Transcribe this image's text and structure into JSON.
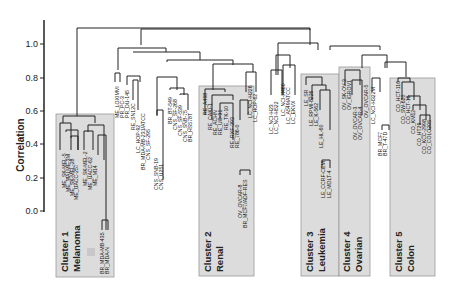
{
  "figure": {
    "y_axis": {
      "label": "Correlation",
      "ticks": [
        "0.0",
        "0.2",
        "0.4",
        "0.6",
        "0.8",
        "1.0"
      ]
    },
    "clusters": [
      {
        "number": "Cluster 1",
        "name": "Melanoma"
      },
      {
        "number": "Cluster 2",
        "name": "Renal"
      },
      {
        "number": "Cluster 3",
        "name": "Leukemia"
      },
      {
        "number": "Cluster 4",
        "name": "Ovarian"
      },
      {
        "number": "Cluster 5",
        "name": "Colon"
      }
    ],
    "leaves": {
      "cluster1": [
        "ME_SK-MEL-5",
        "ME_MALME-3M",
        "ME_SK-MEL-28",
        "ME_UACC-257",
        "ME_SK-MEL-2",
        "ME_UACC-62",
        "ME_M14",
        "BR_MDA-MB-435",
        "BR_MDA-N"
      ],
      "group_a": [
        "ME_LOXIMVI",
        "PR_PC-3",
        "PR_DU-145",
        "RE_SN12C",
        "LC_HOP-92",
        "BR_MDA-MB-231/ATCC",
        "CNS_SF-295",
        "CNS_SNB-19",
        "CNS_U251",
        "BR_BT-549",
        "CNS_SF-268",
        "CNS_SF-539",
        "CNS_SNB-75",
        "BR_HS578T"
      ],
      "cluster2": [
        "RE_A498",
        "RE_CAKI-1",
        "RE_ACHN",
        "RE_UO-31",
        "RE_TK-10",
        "RE_RXF-393",
        "RE_786-0"
      ],
      "group_b": [
        "LC_NCI-H226",
        "LC_HOP-62",
        "OV_OVCAR-8",
        "BR_MCF7/ADF-RES",
        "LC_NCI-H23",
        "LC_NCI-H522",
        "LC_NCI-H460",
        "LC_A549/ATCC",
        "LC_EKVX"
      ],
      "cluster3": [
        "LE_SR",
        "LE_RPMI-8226",
        "LE_K-562",
        "LE_HL-60",
        "LE_CCRF-CEM",
        "LE_MOLT-4"
      ],
      "cluster4": [
        "OV_SK-OV-3",
        "OV_IGROV1",
        "OV_OVCAR-3",
        "OV_OVCAR-4"
      ],
      "group_c": [
        "OV_OVCAR-5",
        "LC_NCI-H322M",
        "BR_MCF7",
        "BR_T-47D"
      ],
      "cluster5": [
        "CO_HCT-116",
        "CO_SW-620",
        "CO_HCT-15",
        "CO_KM12",
        "CO_HT29",
        "CO_KCC-2998",
        "CO_COLO205"
      ]
    }
  }
}
